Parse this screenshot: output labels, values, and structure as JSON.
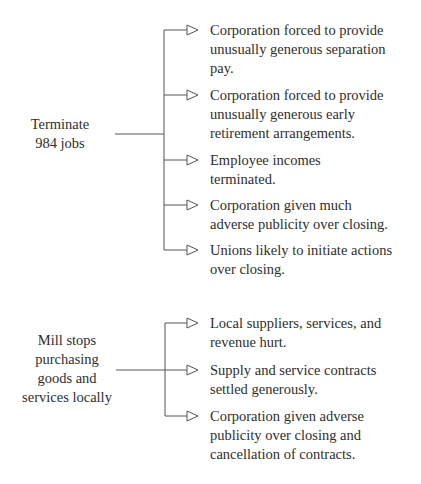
{
  "diagram": {
    "groups": [
      {
        "cause": "Terminate\n984 jobs",
        "effects": [
          "Corporation forced to provide\nunusually generous separation\npay.",
          "Corporation forced to provide\nunusually generous early\nretirement arrangements.",
          "Employee incomes\nterminated.",
          "Corporation given much\nadverse publicity over closing.",
          "Unions likely to initiate actions\nover closing."
        ]
      },
      {
        "cause": "Mill stops\npurchasing\ngoods and\nservices locally",
        "effects": [
          "Local suppliers, services, and\nrevenue hurt.",
          "Supply and service contracts\nsettled generously.",
          "Corporation given adverse\npublicity over closing and\ncancellation of contracts."
        ]
      }
    ],
    "colors": {
      "line": "#555555",
      "text": "#2e2e2e"
    },
    "icons": {
      "branch_arrow": "hollow-triangle-arrow-icon"
    }
  }
}
